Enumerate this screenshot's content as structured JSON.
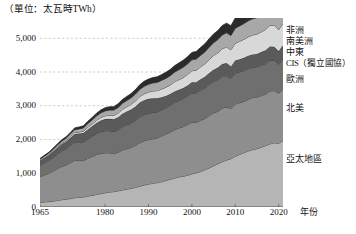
{
  "unit_label": "（單位：太瓦時TWh）",
  "axis": {
    "x_title": "年份",
    "x_ticks": [
      "1965",
      "1980",
      "1990",
      "2000",
      "2010",
      "2020"
    ],
    "y_ticks": [
      "0",
      "1,000",
      "2,000",
      "3,000",
      "4,000",
      "5,000"
    ]
  },
  "legend": [
    {
      "label": "非洲",
      "color": "#2b2b2b"
    },
    {
      "label": "南美洲",
      "color": "#a8a8a8"
    },
    {
      "label": "中東",
      "color": "#d8d8d8"
    },
    {
      "label": "CIS（獨立國協）",
      "color": "#5a5a5a"
    },
    {
      "label": "歐洲",
      "color": "#6f6f6f"
    },
    {
      "label": "北美",
      "color": "#8e8e8e"
    },
    {
      "label": "亞太地區",
      "color": "#b5b5b5"
    }
  ],
  "chart_data": {
    "type": "area",
    "stacked": true,
    "title": "",
    "xlabel": "年份",
    "ylabel": "",
    "unit": "TWh",
    "grid": true,
    "legend_position": "right",
    "xlim": [
      1965,
      2021
    ],
    "ylim": [
      0,
      5600
    ],
    "ytick_values": [
      0,
      1000,
      2000,
      3000,
      4000,
      5000
    ],
    "xtick_values": [
      1965,
      1980,
      1990,
      2000,
      2010,
      2020
    ],
    "x": [
      1965,
      1966,
      1967,
      1968,
      1969,
      1970,
      1971,
      1972,
      1973,
      1974,
      1975,
      1976,
      1977,
      1978,
      1979,
      1980,
      1981,
      1982,
      1983,
      1984,
      1985,
      1986,
      1987,
      1988,
      1989,
      1990,
      1991,
      1992,
      1993,
      1994,
      1995,
      1996,
      1997,
      1998,
      1999,
      2000,
      2001,
      2002,
      2003,
      2004,
      2005,
      2006,
      2007,
      2008,
      2009,
      2010,
      2011,
      2012,
      2013,
      2014,
      2015,
      2016,
      2017,
      2018,
      2019,
      2020,
      2021
    ],
    "series": [
      {
        "name": "亞太地區",
        "color": "#b5b5b5",
        "values": [
          140,
          150,
          160,
          175,
          195,
          215,
          230,
          250,
          275,
          285,
          295,
          320,
          345,
          370,
          395,
          420,
          440,
          455,
          480,
          505,
          530,
          555,
          580,
          615,
          650,
          680,
          700,
          720,
          750,
          785,
          820,
          855,
          890,
          910,
          940,
          980,
          1010,
          1050,
          1100,
          1160,
          1220,
          1280,
          1340,
          1390,
          1430,
          1500,
          1560,
          1610,
          1660,
          1700,
          1730,
          1770,
          1820,
          1870,
          1900,
          1890,
          1960
        ]
      },
      {
        "name": "北美",
        "color": "#8e8e8e",
        "values": [
          760,
          800,
          840,
          890,
          940,
          985,
          1010,
          1060,
          1105,
          1090,
          1080,
          1120,
          1150,
          1185,
          1195,
          1185,
          1165,
          1130,
          1140,
          1185,
          1200,
          1210,
          1245,
          1290,
          1310,
          1315,
          1320,
          1325,
          1350,
          1375,
          1400,
          1430,
          1450,
          1470,
          1500,
          1530,
          1490,
          1520,
          1520,
          1550,
          1570,
          1555,
          1590,
          1570,
          1490,
          1545,
          1530,
          1520,
          1530,
          1545,
          1525,
          1530,
          1520,
          1570,
          1545,
          1480,
          1530
        ]
      },
      {
        "name": "歐洲",
        "color": "#6f6f6f",
        "values": [
          330,
          355,
          375,
          405,
          435,
          465,
          485,
          515,
          545,
          545,
          545,
          575,
          595,
          620,
          645,
          655,
          655,
          650,
          665,
          690,
          705,
          720,
          740,
          765,
          775,
          780,
          785,
          775,
          775,
          780,
          795,
          815,
          820,
          835,
          850,
          870,
          880,
          890,
          905,
          920,
          930,
          940,
          940,
          935,
          890,
          925,
          915,
          910,
          910,
          895,
          900,
          905,
          910,
          915,
          900,
          860,
          895
        ]
      },
      {
        "name": "CIS（獨立國協）",
        "color": "#5a5a5a",
        "values": [
          130,
          140,
          150,
          165,
          180,
          195,
          210,
          225,
          240,
          255,
          270,
          285,
          300,
          315,
          330,
          345,
          355,
          365,
          375,
          385,
          395,
          405,
          415,
          425,
          430,
          430,
          420,
          400,
          380,
          350,
          330,
          325,
          315,
          310,
          310,
          315,
          320,
          325,
          335,
          340,
          350,
          355,
          365,
          370,
          355,
          370,
          375,
          380,
          380,
          380,
          380,
          385,
          395,
          400,
          400,
          390,
          410
        ]
      },
      {
        "name": "中東",
        "color": "#d8d8d8",
        "values": [
          12,
          14,
          16,
          19,
          22,
          26,
          30,
          35,
          41,
          46,
          52,
          60,
          68,
          76,
          85,
          94,
          102,
          110,
          120,
          130,
          140,
          150,
          162,
          175,
          188,
          200,
          212,
          226,
          240,
          255,
          268,
          282,
          296,
          310,
          325,
          340,
          352,
          366,
          382,
          400,
          418,
          436,
          456,
          476,
          490,
          512,
          530,
          548,
          562,
          576,
          588,
          600,
          614,
          628,
          640,
          630,
          650
        ]
      },
      {
        "name": "南美洲",
        "color": "#a8a8a8",
        "values": [
          40,
          44,
          48,
          53,
          58,
          64,
          70,
          77,
          85,
          92,
          100,
          109,
          118,
          128,
          138,
          147,
          154,
          161,
          168,
          176,
          185,
          194,
          203,
          213,
          222,
          230,
          238,
          246,
          255,
          265,
          275,
          286,
          297,
          306,
          315,
          326,
          330,
          340,
          352,
          366,
          380,
          394,
          408,
          420,
          424,
          444,
          456,
          466,
          474,
          482,
          488,
          496,
          506,
          516,
          524,
          510,
          528
        ]
      },
      {
        "name": "非洲",
        "color": "#2b2b2b",
        "values": [
          25,
          27,
          30,
          33,
          36,
          40,
          44,
          48,
          53,
          57,
          62,
          68,
          74,
          80,
          87,
          93,
          98,
          103,
          109,
          115,
          121,
          127,
          134,
          141,
          148,
          154,
          160,
          166,
          172,
          179,
          186,
          193,
          200,
          206,
          212,
          220,
          226,
          233,
          241,
          250,
          259,
          268,
          278,
          287,
          292,
          304,
          311,
          318,
          324,
          330,
          335,
          341,
          348,
          355,
          360,
          354,
          366
        ]
      }
    ]
  }
}
